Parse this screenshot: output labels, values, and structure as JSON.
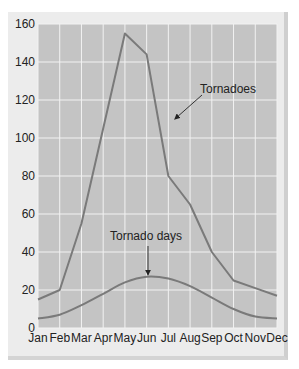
{
  "chart_data": {
    "type": "line",
    "title": "",
    "xlabel": "",
    "ylabel": "",
    "categories": [
      "Jan",
      "Feb",
      "Mar",
      "Apr",
      "May",
      "Jun",
      "Jul",
      "Aug",
      "Sep",
      "Oct",
      "Nov",
      "Dec"
    ],
    "ylim": [
      0,
      160
    ],
    "yticks": [
      0,
      20,
      40,
      60,
      80,
      100,
      120,
      140,
      160
    ],
    "grid": true,
    "series": [
      {
        "name": "Tornadoes",
        "values": [
          15,
          20,
          55,
          105,
          155,
          144,
          80,
          65,
          40,
          25,
          21,
          17
        ]
      },
      {
        "name": "Tornado days",
        "values": [
          5,
          7,
          12,
          18,
          24,
          27,
          26,
          22,
          16,
          10,
          6,
          5
        ]
      }
    ],
    "annotations": [
      {
        "text": "Tornadoes",
        "points_to": {
          "series": "Tornadoes",
          "x": 6.3,
          "y": 110
        }
      },
      {
        "text": "Tornado days",
        "points_to": {
          "series": "Tornado days",
          "x": 5.0,
          "y": 27
        }
      }
    ],
    "colors": {
      "plot_bg": "#c4c4c4",
      "grid": "#f2f2f2",
      "line": "#7a7a7a",
      "frame": "#ececec"
    }
  }
}
